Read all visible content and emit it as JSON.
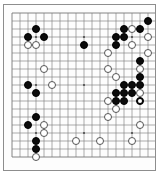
{
  "app": {
    "title": "Go Board Position",
    "board_size": 19,
    "background_color": "#fdfdfd",
    "line_color": "#777777",
    "border_color": "#8d8d8d",
    "black_color": "#0b0b0b",
    "white_color": "#ffffff"
  },
  "board": {
    "size": 19,
    "origin_x": 8,
    "origin_y": 8,
    "spacing": 8.0,
    "stone_radius": 4.3,
    "star_points": [
      [
        3,
        3
      ],
      [
        9,
        3
      ],
      [
        15,
        3
      ],
      [
        3,
        9
      ],
      [
        9,
        9
      ],
      [
        15,
        9
      ],
      [
        3,
        15
      ],
      [
        9,
        15
      ],
      [
        15,
        15
      ]
    ],
    "black_stones": [
      [
        17,
        1
      ],
      [
        14,
        2
      ],
      [
        16,
        2
      ],
      [
        3,
        2
      ],
      [
        2,
        3
      ],
      [
        4,
        3
      ],
      [
        13,
        3
      ],
      [
        14,
        3
      ],
      [
        13,
        4
      ],
      [
        9,
        4
      ],
      [
        16,
        6
      ],
      [
        2,
        9
      ],
      [
        16,
        8
      ],
      [
        3,
        10
      ],
      [
        16,
        9
      ],
      [
        14,
        9
      ],
      [
        15,
        9
      ],
      [
        13,
        10
      ],
      [
        14,
        10
      ],
      [
        15,
        10
      ],
      [
        14,
        11
      ],
      [
        13,
        11
      ],
      [
        16,
        11
      ],
      [
        2,
        14
      ],
      [
        3,
        13
      ],
      [
        3,
        16
      ],
      [
        3,
        17
      ]
    ],
    "white_stones": [
      [
        15,
        2
      ],
      [
        17,
        3
      ],
      [
        15,
        4
      ],
      [
        12,
        5
      ],
      [
        17,
        5
      ],
      [
        2,
        4
      ],
      [
        3,
        4
      ],
      [
        12,
        7
      ],
      [
        4,
        7
      ],
      [
        16,
        7
      ],
      [
        5,
        9
      ],
      [
        13,
        8
      ],
      [
        16,
        10
      ],
      [
        12,
        11
      ],
      [
        13,
        12
      ],
      [
        12,
        13
      ],
      [
        4,
        14
      ],
      [
        4,
        15
      ],
      [
        3,
        18
      ],
      [
        8,
        16
      ],
      [
        16,
        14
      ],
      [
        15,
        16
      ],
      [
        11,
        16
      ]
    ],
    "marked_stone": {
      "position": [
        16,
        11
      ],
      "color": "black",
      "marker": "last-move-circle"
    }
  }
}
